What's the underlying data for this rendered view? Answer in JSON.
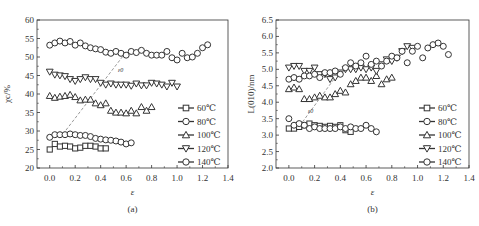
{
  "chart_data": [
    {
      "type": "scatter",
      "panel_label": "(a)",
      "title": "",
      "xlabel": "ε",
      "ylabel": "χc/%",
      "xlim": [
        -0.1,
        1.4
      ],
      "ylim": [
        20,
        60
      ],
      "xticks": [
        "0.0",
        "0.2",
        "0.4",
        "0.6",
        "0.8",
        "1.0",
        "1.2",
        "1.4"
      ],
      "yticks": [
        "20",
        "25",
        "30",
        "35",
        "40",
        "45",
        "50",
        "55",
        "60"
      ],
      "legend_position": "lower right",
      "annotation": "ε0",
      "series": [
        {
          "name": "60℃",
          "marker": "square",
          "x": [
            0,
            0.04,
            0.08,
            0.12,
            0.16,
            0.2,
            0.24,
            0.28,
            0.32,
            0.36,
            0.4,
            0.44
          ],
          "y": [
            25,
            26.5,
            25.8,
            26,
            25.8,
            25.3,
            25.5,
            26,
            26,
            25.8,
            25.3,
            25.3
          ]
        },
        {
          "name": "80℃",
          "marker": "circle",
          "x": [
            0,
            0.04,
            0.08,
            0.12,
            0.16,
            0.2,
            0.24,
            0.28,
            0.32,
            0.36,
            0.4,
            0.44,
            0.48,
            0.52,
            0.56,
            0.6,
            0.64
          ],
          "y": [
            28.3,
            29,
            29,
            29,
            29.2,
            29,
            28.8,
            28.8,
            28.5,
            28,
            27.8,
            27.6,
            27.5,
            27.3,
            27,
            26.5,
            26.8
          ]
        },
        {
          "name": "100℃",
          "marker": "triangle-up",
          "x": [
            0,
            0.04,
            0.08,
            0.12,
            0.16,
            0.2,
            0.24,
            0.28,
            0.32,
            0.36,
            0.4,
            0.44,
            0.48,
            0.52,
            0.56,
            0.6,
            0.64,
            0.68,
            0.72,
            0.76,
            0.8
          ],
          "y": [
            39.5,
            39,
            39.3,
            39.5,
            39.8,
            39.2,
            38.3,
            38.5,
            38.5,
            37.5,
            37,
            37.5,
            35.5,
            35,
            35,
            34.8,
            35.5,
            34.8,
            36.5,
            35.5,
            36.5
          ]
        },
        {
          "name": "120℃",
          "marker": "triangle-down",
          "x": [
            0,
            0.04,
            0.08,
            0.12,
            0.16,
            0.2,
            0.24,
            0.28,
            0.32,
            0.36,
            0.4,
            0.44,
            0.48,
            0.52,
            0.56,
            0.6,
            0.64,
            0.68,
            0.72,
            0.76,
            0.8,
            0.84,
            0.88,
            0.92,
            0.96,
            1.0
          ],
          "y": [
            46,
            45.2,
            45,
            44.8,
            44,
            43.5,
            44,
            44.5,
            44,
            44,
            43,
            42.5,
            42.8,
            42.5,
            42.5,
            42.5,
            42.2,
            42.8,
            42.3,
            42.3,
            43,
            42.8,
            42.5,
            42,
            43,
            42
          ]
        },
        {
          "name": "140℃",
          "marker": "circle",
          "x": [
            0,
            0.04,
            0.08,
            0.12,
            0.16,
            0.2,
            0.24,
            0.28,
            0.32,
            0.36,
            0.4,
            0.44,
            0.48,
            0.52,
            0.56,
            0.6,
            0.64,
            0.68,
            0.72,
            0.76,
            0.8,
            0.84,
            0.88,
            0.92,
            0.96,
            1.0,
            1.04,
            1.08,
            1.12,
            1.16,
            1.2,
            1.24
          ],
          "y": [
            53.2,
            53.8,
            54.3,
            53.8,
            54.2,
            53.2,
            53.8,
            53,
            52.5,
            52.2,
            52,
            51.3,
            51,
            51.5,
            51,
            50.5,
            51.5,
            51.2,
            51.8,
            51,
            50.5,
            50.5,
            50.5,
            51.5,
            49.8,
            49.2,
            51,
            49.8,
            50,
            51,
            52.5,
            53.3
          ]
        }
      ]
    },
    {
      "type": "scatter",
      "panel_label": "(b)",
      "title": "",
      "xlabel": "ε",
      "ylabel": "L(010)/nm",
      "xlim": [
        -0.1,
        1.4
      ],
      "ylim": [
        2.0,
        6.5
      ],
      "xticks": [
        "0.0",
        "0.2",
        "0.4",
        "0.6",
        "0.8",
        "1.0",
        "1.2",
        "1.4"
      ],
      "yticks": [
        "2.0",
        "2.5",
        "3.0",
        "3.5",
        "4.0",
        "4.5",
        "5.0",
        "5.5",
        "6.0",
        "6.5"
      ],
      "legend_position": "lower right",
      "annotation": "ε0",
      "series": [
        {
          "name": "60℃",
          "marker": "square",
          "x": [
            0,
            0.04,
            0.08,
            0.12,
            0.16,
            0.2,
            0.24,
            0.28,
            0.32,
            0.36,
            0.4,
            0.44,
            0.48
          ],
          "y": [
            3.2,
            3.2,
            3.25,
            3.3,
            3.35,
            3.3,
            3.28,
            3.25,
            3.28,
            3.25,
            3.3,
            3.15,
            3.1
          ]
        },
        {
          "name": "80℃",
          "marker": "circle",
          "x": [
            0,
            0.04,
            0.08,
            0.12,
            0.16,
            0.2,
            0.24,
            0.28,
            0.32,
            0.36,
            0.4,
            0.44,
            0.48,
            0.52,
            0.56,
            0.6,
            0.64,
            0.68
          ],
          "y": [
            3.5,
            3.3,
            3.35,
            3.3,
            3.2,
            3.25,
            3.2,
            3.2,
            3.2,
            3.2,
            3.25,
            3.2,
            3.25,
            3.2,
            3.2,
            3.3,
            3.2,
            3.1
          ]
        },
        {
          "name": "100℃",
          "marker": "triangle-up",
          "x": [
            0,
            0.04,
            0.08,
            0.12,
            0.16,
            0.2,
            0.24,
            0.28,
            0.32,
            0.36,
            0.4,
            0.44,
            0.48,
            0.52,
            0.56,
            0.6,
            0.64,
            0.68,
            0.72,
            0.76,
            0.8
          ],
          "y": [
            4.4,
            4.45,
            4.4,
            4.1,
            4.1,
            4.15,
            4.2,
            4.15,
            4.15,
            4.25,
            4.35,
            4.3,
            4.55,
            4.65,
            4.75,
            4.75,
            4.65,
            4.8,
            4.55,
            4.7,
            4.75
          ]
        },
        {
          "name": "120℃",
          "marker": "triangle-down",
          "x": [
            0,
            0.04,
            0.08,
            0.12,
            0.16,
            0.2,
            0.24,
            0.28,
            0.32,
            0.36,
            0.4,
            0.44,
            0.48,
            0.52,
            0.56,
            0.6,
            0.64,
            0.68,
            0.72,
            0.76,
            0.8,
            0.84,
            0.88,
            0.92,
            0.96
          ],
          "y": [
            5.05,
            5.1,
            5.1,
            4.95,
            4.95,
            5.05,
            4.85,
            4.85,
            4.7,
            4.75,
            4.9,
            5.0,
            5.0,
            5.0,
            5.05,
            5.0,
            5.05,
            4.95,
            5.15,
            5.3,
            5.25,
            5.35,
            5.55,
            5.7,
            5.65
          ]
        },
        {
          "name": "140℃",
          "marker": "circle",
          "x": [
            0,
            0.04,
            0.08,
            0.12,
            0.16,
            0.2,
            0.24,
            0.28,
            0.32,
            0.36,
            0.4,
            0.44,
            0.48,
            0.52,
            0.56,
            0.6,
            0.64,
            0.68,
            0.72,
            0.76,
            0.8,
            0.84,
            0.88,
            0.92,
            0.96,
            1.0,
            1.04,
            1.08,
            1.12,
            1.16,
            1.2,
            1.24
          ],
          "y": [
            4.7,
            4.75,
            4.7,
            4.8,
            4.8,
            4.85,
            4.75,
            4.9,
            4.9,
            4.95,
            4.85,
            5.05,
            5.2,
            5.1,
            5.2,
            5.4,
            5.15,
            5.25,
            5.1,
            5.25,
            5.4,
            5.35,
            5.55,
            5.2,
            5.55,
            5.7,
            5.35,
            5.65,
            5.75,
            5.8,
            5.7,
            5.45
          ]
        }
      ]
    }
  ]
}
